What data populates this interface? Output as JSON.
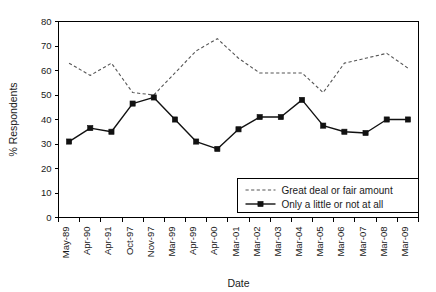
{
  "chart_data": {
    "type": "line",
    "title": "",
    "xlabel": "Date",
    "ylabel": "% Respondents",
    "ylim": [
      0,
      80
    ],
    "yticks": [
      0,
      10,
      20,
      30,
      40,
      50,
      60,
      70,
      80
    ],
    "grid": false,
    "legend_position": "inside-bottom-right",
    "categories": [
      "May-89",
      "Apr-90",
      "Apr-91",
      "Oct-97",
      "Nov-97",
      "Mar-99",
      "Apr-99",
      "Apr-00",
      "Mar-01",
      "Mar-02",
      "Mar-03",
      "Mar-04",
      "Mar-05",
      "Mar-06",
      "Mar-07",
      "Mar-08",
      "Mar-09"
    ],
    "series": [
      {
        "name": "Great deal or fair amount",
        "style": "dashed",
        "marker": "none",
        "color": "#555555",
        "values": [
          63,
          58,
          63,
          51,
          50,
          59,
          68,
          73,
          65,
          59,
          59,
          59,
          51,
          63,
          65,
          67,
          61
        ]
      },
      {
        "name": "Only a little or not at all",
        "style": "solid",
        "marker": "square",
        "color": "#111111",
        "values": [
          31,
          36.5,
          35,
          46.5,
          49,
          40,
          31,
          28,
          36,
          41,
          41,
          48,
          37.5,
          35,
          34.5,
          40,
          40
        ]
      }
    ]
  },
  "axes": {
    "y_title": "% Respondents",
    "x_title": "Date"
  },
  "legend": {
    "items": [
      {
        "label": "Great deal or fair amount",
        "swatch": "dashed-line-swatch"
      },
      {
        "label": "Only a little or not at all",
        "swatch": "solid-line-square-swatch"
      }
    ]
  }
}
